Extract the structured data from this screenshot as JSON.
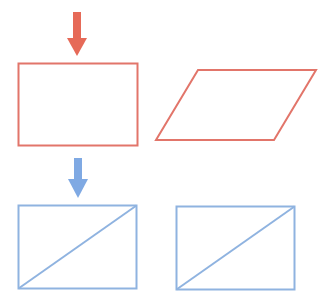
{
  "colors": {
    "red": "#e2756a",
    "red_arrow": "#e66a58",
    "blue": "#8fb3e0",
    "blue_arrow": "#7fa9e3",
    "background": "#ffffff"
  },
  "shapes": [
    {
      "id": "red-arrow",
      "type": "arrow-down",
      "color": "red_arrow"
    },
    {
      "id": "red-rectangle",
      "type": "rectangle",
      "color": "red"
    },
    {
      "id": "red-parallelogram",
      "type": "parallelogram",
      "color": "red"
    },
    {
      "id": "blue-arrow",
      "type": "arrow-down",
      "color": "blue_arrow"
    },
    {
      "id": "blue-rectangle-left",
      "type": "rectangle-with-diagonal",
      "color": "blue"
    },
    {
      "id": "blue-rectangle-right",
      "type": "rectangle-with-diagonal",
      "color": "blue"
    }
  ]
}
